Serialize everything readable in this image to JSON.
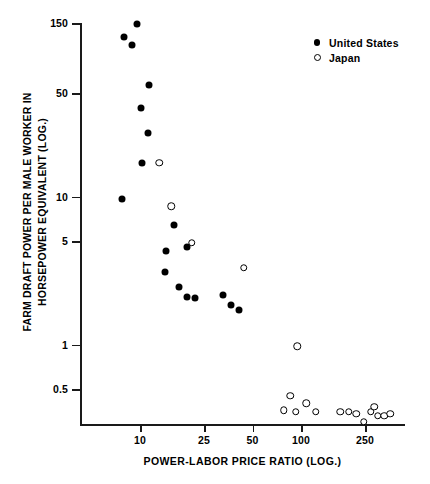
{
  "chart_data": {
    "type": "scatter",
    "title": "",
    "xlabel": "POWER-LABOR PRICE RATIO (LOG.)",
    "ylabel_line1": "FARM DRAFT POWER PER MALE WORKER IN",
    "ylabel_line2": "HORSEPOWER EQUIVALENT (LOG.)",
    "xscale": "log",
    "yscale": "log",
    "grid": false,
    "xticks": [
      10,
      25,
      50,
      100,
      250
    ],
    "xtick_labels": [
      "10",
      "25",
      "50",
      "100",
      "250"
    ],
    "yticks": [
      150,
      50,
      10,
      5,
      1,
      0.5
    ],
    "ytick_labels": [
      "150",
      "50",
      "10",
      "5",
      "1",
      "0.5"
    ],
    "xlim": [
      5,
      420
    ],
    "ylim": [
      0.3,
      180
    ],
    "legend_position": "top-right",
    "series": [
      {
        "name": "United States",
        "marker": "filled-circle",
        "color": "#000000",
        "points": [
          {
            "x": 9.6,
            "y": 148
          },
          {
            "x": 8.0,
            "y": 120
          },
          {
            "x": 8.9,
            "y": 107
          },
          {
            "x": 11.4,
            "y": 57
          },
          {
            "x": 10.1,
            "y": 40
          },
          {
            "x": 11.2,
            "y": 27
          },
          {
            "x": 10.3,
            "y": 17
          },
          {
            "x": 7.7,
            "y": 9.7
          },
          {
            "x": 16.3,
            "y": 6.4
          },
          {
            "x": 19.7,
            "y": 4.6
          },
          {
            "x": 14.6,
            "y": 4.3
          },
          {
            "x": 14.4,
            "y": 3.1
          },
          {
            "x": 17.5,
            "y": 2.45
          },
          {
            "x": 19.6,
            "y": 2.1
          },
          {
            "x": 22.0,
            "y": 2.05
          },
          {
            "x": 33.0,
            "y": 2.15
          },
          {
            "x": 36.5,
            "y": 1.85
          },
          {
            "x": 41.0,
            "y": 1.7
          }
        ]
      },
      {
        "name": "Japan",
        "marker": "open-circle",
        "color": "#000000",
        "points": [
          {
            "x": 13.2,
            "y": 17
          },
          {
            "x": 15.6,
            "y": 8.6
          },
          {
            "x": 21.0,
            "y": 4.9
          },
          {
            "x": 44.0,
            "y": 3.3
          },
          {
            "x": 95.0,
            "y": 0.97
          },
          {
            "x": 86.0,
            "y": 0.45
          },
          {
            "x": 78.0,
            "y": 0.36
          },
          {
            "x": 93.0,
            "y": 0.35
          },
          {
            "x": 108.0,
            "y": 0.4
          },
          {
            "x": 124.0,
            "y": 0.35
          },
          {
            "x": 176.0,
            "y": 0.35
          },
          {
            "x": 198.0,
            "y": 0.35
          },
          {
            "x": 221.0,
            "y": 0.34
          },
          {
            "x": 245.0,
            "y": 0.3
          },
          {
            "x": 272.0,
            "y": 0.35
          },
          {
            "x": 285.0,
            "y": 0.38
          },
          {
            "x": 300.0,
            "y": 0.33
          },
          {
            "x": 330.0,
            "y": 0.33
          },
          {
            "x": 360.0,
            "y": 0.34
          }
        ]
      }
    ]
  },
  "legend": {
    "items": [
      {
        "label": "United States",
        "marker": "filled-circle"
      },
      {
        "label": "Japan",
        "marker": "open-circle"
      }
    ]
  }
}
